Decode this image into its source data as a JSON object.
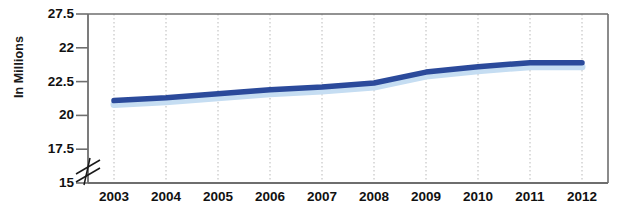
{
  "chart_data": {
    "type": "line",
    "title": "",
    "xlabel": "",
    "ylabel": "In Millions",
    "categories": [
      "2003",
      "2004",
      "2005",
      "2006",
      "2007",
      "2008",
      "2009",
      "2010",
      "2011",
      "2012"
    ],
    "values": [
      21.1,
      21.3,
      21.6,
      21.9,
      22.1,
      22.4,
      23.2,
      23.6,
      23.9,
      23.9
    ],
    "series": [
      {
        "name": "In Millions",
        "values": [
          21.1,
          21.3,
          21.6,
          21.9,
          22.1,
          22.4,
          23.2,
          23.6,
          23.9,
          23.9
        ],
        "color": "#2b4a9b",
        "shadow_color": "#c5ddf2"
      }
    ],
    "ytick_labels": [
      "27.5",
      "22",
      "22.5",
      "20",
      "17.5",
      "15"
    ],
    "ytick_values": [
      27.5,
      25.0,
      22.5,
      20.0,
      17.5,
      15.0
    ],
    "ylim": [
      15,
      27.5
    ],
    "axis_break": true,
    "grid": "vertical-dotted",
    "legend": "none",
    "line_color": "#2b4a9b",
    "shadow_color": "#c5ddf2",
    "plot_border_color": "#6e6e6e",
    "gridline_color": "#b9b9b9"
  }
}
